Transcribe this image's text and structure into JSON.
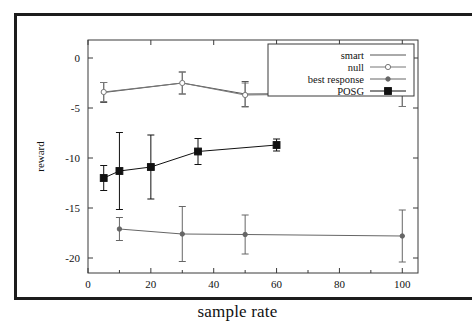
{
  "chart_data": {
    "type": "line",
    "title": "",
    "xlabel": "sample rate",
    "ylabel": "reward",
    "xlim": [
      0,
      105
    ],
    "ylim": [
      -21.5,
      1.8
    ],
    "xticks": [
      "0",
      "20",
      "40",
      "60",
      "80",
      "100"
    ],
    "xtick_values": [
      0,
      20,
      40,
      60,
      80,
      100
    ],
    "yticks": [
      "0",
      "-5",
      "-10",
      "-15",
      "-20"
    ],
    "ytick_values": [
      0,
      -5,
      -10,
      -15,
      -20
    ],
    "grid": false,
    "legend_position": "top-right",
    "error_bars": true,
    "series": [
      {
        "name": "smart",
        "marker": "none",
        "color": "#555555",
        "x": [
          5,
          30,
          50,
          100
        ],
        "y": [
          -3.45,
          -2.5,
          -3.6,
          -3.5
        ],
        "yerr": [
          1.0,
          1.1,
          1.25,
          1.35
        ]
      },
      {
        "name": "null",
        "marker": "open-circle",
        "color": "#777777",
        "x": [
          5,
          30,
          50,
          100
        ],
        "y": [
          -3.4,
          -2.5,
          -3.7,
          -3.5
        ],
        "yerr": [
          0.95,
          1.1,
          1.2,
          1.35
        ]
      },
      {
        "name": "best response",
        "marker": "dot",
        "color": "#666666",
        "x": [
          10,
          30,
          50,
          100
        ],
        "y": [
          -17.1,
          -17.6,
          -17.65,
          -17.8
        ],
        "yerr": [
          1.15,
          2.75,
          1.95,
          2.6
        ]
      },
      {
        "name": "POSG",
        "marker": "filled-square",
        "color": "#111111",
        "x": [
          5,
          10,
          20,
          35,
          60
        ],
        "y": [
          -12.0,
          -11.3,
          -10.9,
          -9.35,
          -8.7
        ],
        "yerr": [
          1.25,
          3.85,
          3.2,
          1.3,
          0.6
        ]
      }
    ]
  },
  "legend": {
    "items": [
      {
        "label": "smart"
      },
      {
        "label": "null"
      },
      {
        "label": "best response"
      },
      {
        "label": "POSG"
      }
    ]
  },
  "axes": {
    "x_title": "sample rate",
    "y_title": "reward"
  }
}
